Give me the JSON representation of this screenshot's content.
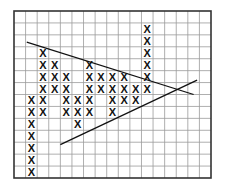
{
  "chart_data": {
    "type": "point-and-figure",
    "title": "",
    "xlabel": "",
    "ylabel": "",
    "grid": {
      "columns": 17,
      "rows": 14,
      "on": true
    },
    "symbol": "X",
    "columns": [
      {
        "col": 1,
        "rows": [
          7,
          8,
          9,
          10,
          11,
          12,
          13
        ]
      },
      {
        "col": 2,
        "rows": [
          3,
          4,
          5,
          6,
          7,
          8
        ]
      },
      {
        "col": 3,
        "rows": [
          4,
          5,
          6
        ]
      },
      {
        "col": 4,
        "rows": [
          5,
          6,
          7,
          8
        ]
      },
      {
        "col": 5,
        "rows": [
          7,
          8,
          9
        ]
      },
      {
        "col": 6,
        "rows": [
          4,
          5,
          6,
          7,
          8
        ]
      },
      {
        "col": 7,
        "rows": [
          5,
          6
        ]
      },
      {
        "col": 8,
        "rows": [
          5,
          6,
          7,
          8
        ]
      },
      {
        "col": 9,
        "rows": [
          5,
          6,
          7
        ]
      },
      {
        "col": 10,
        "rows": [
          6,
          7
        ]
      },
      {
        "col": 11,
        "rows": [
          1,
          2,
          3,
          4,
          5,
          6
        ]
      }
    ],
    "trendlines": [
      {
        "name": "descending-resistance",
        "from": [
          1.1,
          2.6
        ],
        "to": [
          15.5,
          7.0
        ]
      },
      {
        "name": "ascending-support",
        "from": [
          4.0,
          11.2
        ],
        "to": [
          15.8,
          5.8
        ]
      }
    ]
  },
  "style": {
    "grid_color": "#9a9a9a",
    "border_color": "#333333",
    "symbol_color": "#111111",
    "line_color": "#111111"
  }
}
